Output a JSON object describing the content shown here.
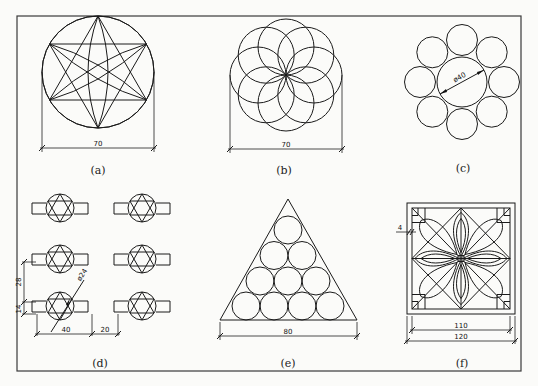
{
  "figures": [
    {
      "id": "a",
      "caption": "(a)",
      "description": "Six-pointed star with arcs inscribed in circle",
      "dimensions": [
        {
          "label": "70",
          "type": "horizontal"
        }
      ]
    },
    {
      "id": "b",
      "caption": "(b)",
      "description": "Eight overlapping circles forming a rosette",
      "dimensions": [
        {
          "label": "70",
          "type": "horizontal"
        }
      ]
    },
    {
      "id": "c",
      "caption": "(c)",
      "description": "Central circle surrounded by eight tangent circles",
      "dimensions": [
        {
          "label": "ø40",
          "type": "diameter"
        }
      ]
    },
    {
      "id": "d",
      "caption": "(d)",
      "description": "Array of six circle-star shapes with side tabs",
      "dimensions": [
        {
          "label": "28",
          "type": "vertical"
        },
        {
          "label": "14",
          "type": "vertical"
        },
        {
          "label": "ø24",
          "type": "diameter"
        },
        {
          "label": "40",
          "type": "horizontal"
        },
        {
          "label": "20",
          "type": "horizontal"
        }
      ]
    },
    {
      "id": "e",
      "caption": "(e)",
      "description": "Ten circles packed inside an equilateral triangle",
      "dimensions": [
        {
          "label": "80",
          "type": "horizontal"
        }
      ]
    },
    {
      "id": "f",
      "caption": "(f)",
      "description": "Square lattice window pattern with heart/petal motifs",
      "dimensions": [
        {
          "label": "4",
          "type": "offset"
        },
        {
          "label": "110",
          "type": "horizontal"
        },
        {
          "label": "120",
          "type": "horizontal"
        }
      ]
    }
  ],
  "colors": {
    "line": "#1a1a1a",
    "background": "#fbfbf9",
    "frame": "#3a3a3a"
  }
}
